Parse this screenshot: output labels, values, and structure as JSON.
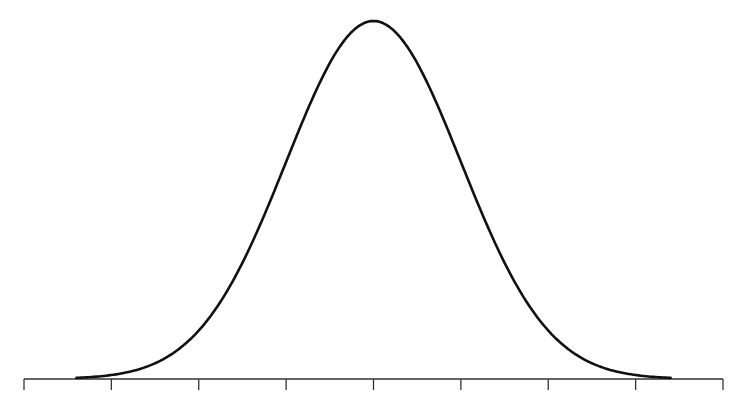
{
  "chart_data": {
    "type": "line",
    "title": "",
    "xlabel": "",
    "ylabel": "",
    "distribution": {
      "mean": 0,
      "sd": 1
    },
    "x_ticks": [
      -4,
      -3,
      -2,
      -1,
      0,
      1,
      2,
      3,
      4
    ],
    "x_tick_labels": [],
    "xlim": [
      -4,
      4
    ],
    "curve_x_range": [
      -3.4,
      3.4
    ],
    "series": [
      {
        "name": "density",
        "x": [
          -3.4,
          -3,
          -2.5,
          -2,
          -1.5,
          -1,
          -0.5,
          0,
          0.5,
          1,
          1.5,
          2,
          2.5,
          3,
          3.4
        ],
        "values": [
          0.0012,
          0.0044,
          0.0175,
          0.054,
          0.1295,
          0.242,
          0.3521,
          0.3989,
          0.3521,
          0.242,
          0.1295,
          0.054,
          0.0175,
          0.0044,
          0.0012
        ]
      }
    ],
    "grid": false,
    "legend": null,
    "y_axis_visible": false,
    "colors": {
      "curve": "#111111",
      "axis": "#333333",
      "background": "#ffffff"
    }
  }
}
